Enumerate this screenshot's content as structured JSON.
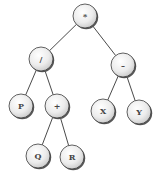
{
  "diagram": {
    "type": "expression-tree",
    "nodes": [
      {
        "id": "root",
        "label": "*",
        "x": 85,
        "y": 16
      },
      {
        "id": "div",
        "label": "/",
        "x": 41,
        "y": 59
      },
      {
        "id": "minus",
        "label": "–",
        "x": 123,
        "y": 65
      },
      {
        "id": "P",
        "label": "P",
        "x": 21,
        "y": 106
      },
      {
        "id": "plus",
        "label": "+",
        "x": 57,
        "y": 106
      },
      {
        "id": "X",
        "label": "X",
        "x": 103,
        "y": 111
      },
      {
        "id": "Y",
        "label": "Y",
        "x": 139,
        "y": 112
      },
      {
        "id": "Q",
        "label": "Q",
        "x": 38,
        "y": 156
      },
      {
        "id": "R",
        "label": "R",
        "x": 72,
        "y": 157
      }
    ],
    "edges": [
      {
        "from": "root",
        "to": "div"
      },
      {
        "from": "root",
        "to": "minus"
      },
      {
        "from": "div",
        "to": "P"
      },
      {
        "from": "div",
        "to": "plus"
      },
      {
        "from": "plus",
        "to": "Q"
      },
      {
        "from": "plus",
        "to": "R"
      },
      {
        "from": "minus",
        "to": "X"
      },
      {
        "from": "minus",
        "to": "Y"
      }
    ],
    "node_radius": 12,
    "colors": {
      "node_fill_light": "#fafafa",
      "node_fill_dark": "#d4d4d4",
      "edge": "#4a4a4a",
      "label": "#444444"
    }
  }
}
